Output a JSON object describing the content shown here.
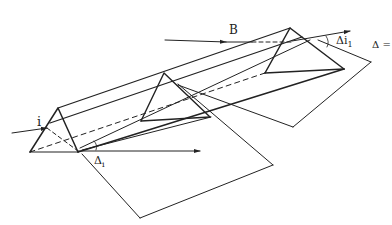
{
  "figure": {
    "stroke_color": "#222222",
    "background": "#ffffff"
  },
  "labels": {
    "incident_ray": "i",
    "beam": "B",
    "deviation_bottom": "Δ",
    "deviation_bottom_sub": "i",
    "deviation_top": "Δi",
    "deviation_top_sub": "1",
    "equation_fragment": "Δ ="
  }
}
